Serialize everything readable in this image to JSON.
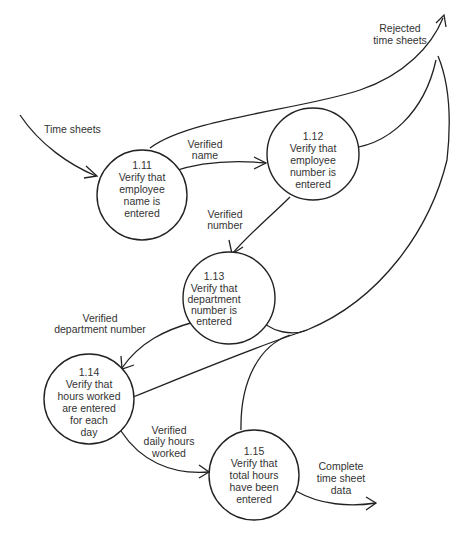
{
  "diagram": {
    "type": "data-flow-diagram",
    "processes": [
      {
        "id": "1.11",
        "lines": [
          "1.11",
          "Verify that",
          "employee",
          "name is",
          "entered"
        ]
      },
      {
        "id": "1.12",
        "lines": [
          "1.12",
          "Verify that",
          "employee",
          "number is",
          "entered"
        ]
      },
      {
        "id": "1.13",
        "lines": [
          "1.13",
          "Verify that",
          "department",
          "number is",
          "entered"
        ]
      },
      {
        "id": "1.14",
        "lines": [
          "1.14",
          "Verify that",
          "hours worked",
          "are entered",
          "for each",
          "day"
        ]
      },
      {
        "id": "1.15",
        "lines": [
          "1.15",
          "Verify that",
          "total hours",
          "have been",
          "entered"
        ]
      }
    ],
    "flows": [
      {
        "id": "time-sheets",
        "lines": [
          "Time sheets"
        ],
        "from": "external",
        "to": "1.11"
      },
      {
        "id": "verified-name",
        "lines": [
          "Verified",
          "name"
        ],
        "from": "1.11",
        "to": "1.12"
      },
      {
        "id": "verified-number",
        "lines": [
          "Verified",
          "number"
        ],
        "from": "1.12",
        "to": "1.13"
      },
      {
        "id": "verified-department-number",
        "lines": [
          "Verified",
          "department number"
        ],
        "from": "1.13",
        "to": "1.14"
      },
      {
        "id": "verified-daily-hours",
        "lines": [
          "Verified",
          "daily hours",
          "worked"
        ],
        "from": "1.14",
        "to": "1.15"
      },
      {
        "id": "complete-data",
        "lines": [
          "Complete",
          "time sheet",
          "data"
        ],
        "from": "1.15",
        "to": "external"
      },
      {
        "id": "rejected",
        "lines": [
          "Rejected",
          "time sheets"
        ],
        "from": [
          "1.11",
          "1.12",
          "1.13",
          "1.14",
          "1.15"
        ],
        "to": "external"
      }
    ]
  }
}
